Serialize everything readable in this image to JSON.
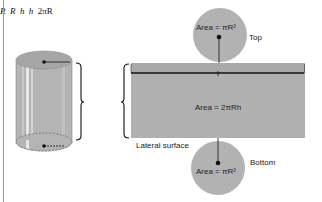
{
  "diagram": {
    "cylinder": {
      "radius_label_top": "R",
      "radius_label_bottom": "R",
      "height_label": "h"
    },
    "net": {
      "height_label": "h",
      "width_label": "2πR",
      "lateral_area": "Area = 2πRh",
      "lateral_caption": "Lateral surface",
      "top_area": "Area = πR²",
      "top_caption": "Top",
      "bottom_area": "Area = πR²",
      "bottom_caption": "Bottom"
    },
    "colors": {
      "fill": "#b0b0b0",
      "cylinder_top": "#a8a8a8",
      "line": "#111111"
    }
  }
}
